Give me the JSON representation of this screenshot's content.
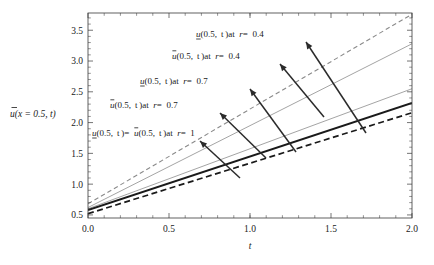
{
  "chart_data": {
    "type": "line",
    "title": "",
    "xlabel": "t",
    "ylabel": "ũ(x = 0.5, t)",
    "xlim": [
      0.0,
      2.0
    ],
    "ylim": [
      0.45,
      3.78
    ],
    "grid": false,
    "legend": "none",
    "xticks": [
      "0.0",
      "0.5",
      "1.0",
      "1.5",
      "2.0"
    ],
    "xtick_values": [
      0.0,
      0.5,
      1.0,
      1.5,
      2.0
    ],
    "yticks": [
      "0.5",
      "1.0",
      "1.5",
      "2.0",
      "2.5",
      "3.0",
      "3.5"
    ],
    "ytick_values": [
      0.5,
      1.0,
      1.5,
      2.0,
      2.5,
      3.0,
      3.5
    ],
    "series": [
      {
        "name": "u_lower(0.5,t) at r=0.4",
        "style": "dashed",
        "color": "#8a8a8a",
        "width": 1.1,
        "x": [
          0.0,
          2.0
        ],
        "values": [
          0.68,
          3.76
        ]
      },
      {
        "name": "u_upper(0.5,t) at r=0.4",
        "style": "solid",
        "color": "#9a9a9a",
        "width": 0.9,
        "x": [
          0.0,
          2.0
        ],
        "values": [
          0.62,
          3.28
        ]
      },
      {
        "name": "u_lower(0.5,t) at r=0.7",
        "style": "solid",
        "color": "#9a9a9a",
        "width": 0.9,
        "x": [
          0.0,
          2.0
        ],
        "values": [
          0.6,
          2.55
        ]
      },
      {
        "name": "u_lower(0.5,t) = u_upper(0.5,t) at r=1",
        "style": "solid",
        "color": "#1a1a1a",
        "width": 1.9,
        "x": [
          0.0,
          2.0
        ],
        "values": [
          0.58,
          2.32
        ]
      },
      {
        "name": "u_upper(0.5,t) at r=0.7",
        "style": "dashed",
        "color": "#1a1a1a",
        "width": 1.7,
        "x": [
          0.0,
          2.0
        ],
        "values": [
          0.52,
          2.16
        ]
      }
    ],
    "annotations": [
      {
        "id": "annot-lower-r04",
        "text": "u(0.5, t) at r = 0.4",
        "u_style": "underline",
        "parts": {
          "u": "u",
          "rest": "(0.5, t)",
          "at": " at ",
          "r": "r",
          "eq": " = ",
          "val": "0.4"
        },
        "label_x": 196,
        "label_y": 37,
        "arrow_from_x": 306,
        "arrow_from_y": 42,
        "arrow_to_x": 366,
        "arrow_to_y": 133
      },
      {
        "id": "annot-upper-r04",
        "text": "ū(0.5, t) at r = 0.4",
        "u_style": "overline",
        "parts": {
          "u": "u",
          "rest": "(0.5, t)",
          "at": " at ",
          "r": "r",
          "eq": " = ",
          "val": "0.4"
        },
        "label_x": 172,
        "label_y": 59,
        "arrow_from_x": 280,
        "arrow_from_y": 64,
        "arrow_to_x": 324,
        "arrow_to_y": 117
      },
      {
        "id": "annot-lower-r07",
        "text": "u(0.5, t) at r = 0.7",
        "u_style": "underline",
        "parts": {
          "u": "u",
          "rest": "(0.5, t)",
          "at": " at ",
          "r": "r",
          "eq": " = ",
          "val": "0.7"
        },
        "label_x": 140,
        "label_y": 84,
        "arrow_from_x": 250,
        "arrow_from_y": 89,
        "arrow_to_x": 296,
        "arrow_to_y": 152
      },
      {
        "id": "annot-upper-r07",
        "text": "ū(0.5, t) at r = 0.7",
        "u_style": "overline",
        "parts": {
          "u": "u",
          "rest": "(0.5, t)",
          "at": " at ",
          "r": "r",
          "eq": " = ",
          "val": "0.7"
        },
        "label_x": 110,
        "label_y": 108,
        "arrow_from_x": 220,
        "arrow_from_y": 113,
        "arrow_to_x": 266,
        "arrow_to_y": 158
      },
      {
        "id": "annot-r1",
        "text": "u(0.5, t) = ū(0.5, t) at r = 1",
        "u_style": "mixed",
        "parts": {
          "u": "u",
          "rest": "(0.5, t)",
          "eq1": " = ",
          "u2": "u",
          "rest2": "(0.5, t)",
          "at": " at ",
          "r": "r",
          "eq": " = ",
          "val": "1"
        },
        "label_x": 92,
        "label_y": 136,
        "arrow_from_x": 200,
        "arrow_from_y": 141,
        "arrow_to_x": 240,
        "arrow_to_y": 178
      }
    ]
  },
  "axis": {
    "x_title": "t",
    "y_title_u": "u",
    "y_title_rest": "(x = 0.5, t)"
  }
}
